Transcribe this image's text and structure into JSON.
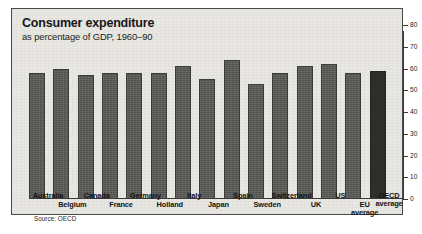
{
  "chart_data": {
    "type": "bar",
    "title": "Consumer expenditure",
    "subtitle": "as percentage of GDP, 1960–90",
    "source": "Source: OECD",
    "xlabel": "",
    "ylabel": "",
    "ylim": [
      0,
      80
    ],
    "yticks": [
      0,
      10,
      20,
      30,
      40,
      50,
      60,
      70,
      80
    ],
    "axis_position": "right",
    "grid": false,
    "legend": false,
    "bar_color": "#595956",
    "accent_color": "#2e2e2d",
    "categories": [
      "Australia",
      "Belgium",
      "Canada",
      "France",
      "Germany",
      "Holland",
      "Italy",
      "Japan",
      "Spain",
      "Sweden",
      "Switzerland",
      "UK",
      "US",
      "EU average",
      "OECD average"
    ],
    "values": [
      58,
      60,
      57,
      58,
      58,
      58,
      61,
      55,
      64,
      53,
      58,
      61,
      62,
      58,
      59
    ],
    "highlight_index": 14
  },
  "x_label_rows": {
    "top": [
      "Australia",
      "Canada",
      "Germany",
      "Italy",
      "Spain",
      "Switzerland",
      "US",
      "OECD average"
    ],
    "bottom": [
      "Belgium",
      "France",
      "Holland",
      "Japan",
      "Sweden",
      "UK",
      "EU average"
    ]
  }
}
